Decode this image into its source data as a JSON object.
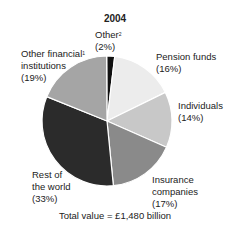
{
  "chart_data": {
    "type": "pie",
    "title": "2004",
    "subtitle": "Total value = £1,480 billion",
    "categories": [
      "Other",
      "Pension funds",
      "Individuals",
      "Insurance companies",
      "Rest of the world",
      "Other financial institutions"
    ],
    "values": [
      2,
      16,
      14,
      17,
      33,
      19
    ],
    "unit": "%",
    "colors": [
      "#111111",
      "#ececec",
      "#c8c8c8",
      "#8a8a8a",
      "#2b2b2b",
      "#a5a5a5"
    ],
    "footnote_markers": {
      "Other": "2",
      "Other financial institutions": "1"
    }
  },
  "labels": {
    "title": "2004",
    "other": {
      "name": "Other",
      "sup": "2",
      "pct": "(2%)"
    },
    "pension": {
      "name": "Pension funds",
      "pct": "(16%)"
    },
    "individuals": {
      "name": "Individuals",
      "pct": "(14%)"
    },
    "insurance": {
      "line1": "Insurance",
      "line2": "companies",
      "pct": "(17%)"
    },
    "rest": {
      "line1": "Rest of",
      "line2": "the world",
      "pct": "(33%)"
    },
    "ofi": {
      "line1": "Other financial",
      "sup": "1",
      "line2": "institutions",
      "pct": "(19%)"
    },
    "total": "Total value = £1,480 billion"
  }
}
